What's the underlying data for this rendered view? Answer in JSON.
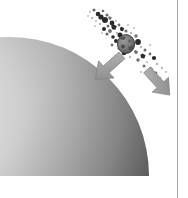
{
  "figure": {
    "title": "Planetary limb with disrupted-body debris stream and motion arrows",
    "caption": "",
    "background_color": "#ffffff",
    "width": 188,
    "height": 198,
    "style": "grayscale halftone illustration"
  },
  "planet": {
    "name": "planet-limb",
    "label": "",
    "description": "Large sphere quadrant occupying the lower-left, limb curving from upper-left down to lower-right, cropped by the frame.",
    "center_x": 10,
    "center_y": 176,
    "radius": 136,
    "highlight_color": "#e9e9e9",
    "midtone_color": "#b4b4b4",
    "terminator_color": "#5a5a5a",
    "edge_color": "#3c3c3c",
    "bounds": {
      "left": 12,
      "top": 38,
      "right": 150,
      "bottom": 176
    }
  },
  "debris": {
    "name": "debris-stream",
    "label": "",
    "description": "Diagonal scattering of dark fragments running from upper-left to lower-right across the upper-right of the frame.",
    "axis_start": {
      "x": 86,
      "y": 10
    },
    "axis_end": {
      "x": 170,
      "y": 80
    },
    "fragment_count": 86,
    "color_dark": "#2b2b2b",
    "color_mid": "#6e6e6e",
    "color_light": "#a8a8a8",
    "primary_body": {
      "name": "primary-fragment",
      "cx": 126,
      "cy": 44,
      "rx": 8.5,
      "ry": 9.5,
      "fill": "#787878",
      "stroke": "#2f2f2f"
    },
    "fragments": [
      {
        "x": 90,
        "y": 12,
        "r": 1.1,
        "tone": "light"
      },
      {
        "x": 94,
        "y": 10,
        "r": 1.6,
        "tone": "mid"
      },
      {
        "x": 98,
        "y": 14,
        "r": 2.3,
        "tone": "dark"
      },
      {
        "x": 92,
        "y": 18,
        "r": 1.2,
        "tone": "light"
      },
      {
        "x": 103,
        "y": 11,
        "r": 1.3,
        "tone": "mid"
      },
      {
        "x": 101,
        "y": 17,
        "r": 2.6,
        "tone": "dark"
      },
      {
        "x": 107,
        "y": 15,
        "r": 1.5,
        "tone": "mid"
      },
      {
        "x": 96,
        "y": 21,
        "r": 1.0,
        "tone": "light"
      },
      {
        "x": 105,
        "y": 20,
        "r": 3.0,
        "tone": "dark"
      },
      {
        "x": 110,
        "y": 18,
        "r": 1.8,
        "tone": "mid"
      },
      {
        "x": 100,
        "y": 24,
        "r": 1.2,
        "tone": "light"
      },
      {
        "x": 112,
        "y": 23,
        "r": 2.4,
        "tone": "dark"
      },
      {
        "x": 108,
        "y": 26,
        "r": 1.5,
        "tone": "mid"
      },
      {
        "x": 116,
        "y": 21,
        "r": 1.1,
        "tone": "light"
      },
      {
        "x": 104,
        "y": 29,
        "r": 2.0,
        "tone": "dark"
      },
      {
        "x": 114,
        "y": 27,
        "r": 2.8,
        "tone": "dark"
      },
      {
        "x": 119,
        "y": 25,
        "r": 1.4,
        "tone": "mid"
      },
      {
        "x": 110,
        "y": 31,
        "r": 1.9,
        "tone": "mid"
      },
      {
        "x": 122,
        "y": 29,
        "r": 2.2,
        "tone": "dark"
      },
      {
        "x": 117,
        "y": 33,
        "r": 1.3,
        "tone": "light"
      },
      {
        "x": 107,
        "y": 34,
        "r": 1.6,
        "tone": "mid"
      },
      {
        "x": 126,
        "y": 31,
        "r": 1.5,
        "tone": "mid"
      },
      {
        "x": 120,
        "y": 35,
        "r": 2.5,
        "tone": "dark"
      },
      {
        "x": 113,
        "y": 37,
        "r": 1.8,
        "tone": "dark"
      },
      {
        "x": 131,
        "y": 33,
        "r": 1.2,
        "tone": "light"
      },
      {
        "x": 116,
        "y": 41,
        "r": 2.0,
        "tone": "dark"
      },
      {
        "x": 136,
        "y": 36,
        "r": 1.7,
        "tone": "mid"
      },
      {
        "x": 112,
        "y": 45,
        "r": 1.4,
        "tone": "mid"
      },
      {
        "x": 138,
        "y": 42,
        "r": 2.9,
        "tone": "dark"
      },
      {
        "x": 118,
        "y": 49,
        "r": 1.1,
        "tone": "light"
      },
      {
        "x": 133,
        "y": 46,
        "r": 1.6,
        "tone": "mid"
      },
      {
        "x": 141,
        "y": 47,
        "r": 1.3,
        "tone": "light"
      },
      {
        "x": 124,
        "y": 53,
        "r": 2.3,
        "tone": "dark"
      },
      {
        "x": 136,
        "y": 52,
        "r": 2.0,
        "tone": "mid"
      },
      {
        "x": 145,
        "y": 50,
        "r": 1.5,
        "tone": "mid"
      },
      {
        "x": 130,
        "y": 57,
        "r": 1.2,
        "tone": "light"
      },
      {
        "x": 143,
        "y": 56,
        "r": 2.6,
        "tone": "dark"
      },
      {
        "x": 150,
        "y": 54,
        "r": 1.4,
        "tone": "mid"
      },
      {
        "x": 138,
        "y": 60,
        "r": 1.7,
        "tone": "mid"
      },
      {
        "x": 147,
        "y": 62,
        "r": 1.1,
        "tone": "light"
      },
      {
        "x": 154,
        "y": 58,
        "r": 2.1,
        "tone": "dark"
      },
      {
        "x": 144,
        "y": 66,
        "r": 1.5,
        "tone": "mid"
      },
      {
        "x": 157,
        "y": 64,
        "r": 1.3,
        "tone": "light"
      },
      {
        "x": 151,
        "y": 69,
        "r": 1.8,
        "tone": "mid"
      },
      {
        "x": 162,
        "y": 68,
        "r": 1.2,
        "tone": "light"
      },
      {
        "x": 156,
        "y": 73,
        "r": 1.4,
        "tone": "mid"
      },
      {
        "x": 166,
        "y": 72,
        "r": 1.0,
        "tone": "light"
      },
      {
        "x": 160,
        "y": 78,
        "r": 1.3,
        "tone": "light"
      },
      {
        "x": 88,
        "y": 16,
        "r": 0.9,
        "tone": "light"
      },
      {
        "x": 95,
        "y": 26,
        "r": 0.9,
        "tone": "light"
      },
      {
        "x": 102,
        "y": 33,
        "r": 0.9,
        "tone": "light"
      },
      {
        "x": 128,
        "y": 25,
        "r": 1.0,
        "tone": "light"
      },
      {
        "x": 134,
        "y": 28,
        "r": 0.9,
        "tone": "light"
      },
      {
        "x": 122,
        "y": 60,
        "r": 0.9,
        "tone": "light"
      },
      {
        "x": 150,
        "y": 45,
        "r": 1.0,
        "tone": "light"
      },
      {
        "x": 141,
        "y": 72,
        "r": 1.0,
        "tone": "light"
      }
    ]
  },
  "arrows": [
    {
      "name": "motion-arrow-left",
      "label": "",
      "direction": "down-left",
      "angle_deg": 228,
      "tail_x": 118,
      "tail_y": 53,
      "tip_x": 99,
      "tip_y": 78,
      "fill": "#9d9d9d",
      "stroke": "#7a7a7a"
    },
    {
      "name": "motion-arrow-right",
      "label": "",
      "direction": "down-right",
      "angle_deg": 312,
      "tail_x": 146,
      "tail_y": 69,
      "tip_x": 167,
      "tip_y": 93,
      "fill": "#9d9d9d",
      "stroke": "#7a7a7a"
    }
  ],
  "frame": {
    "name": "right-rule",
    "label": "",
    "x": 177.5,
    "y_start": 0,
    "y_end": 198,
    "color": "#a9a9a9",
    "width": 1
  }
}
